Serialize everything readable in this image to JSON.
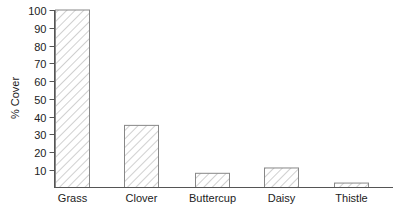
{
  "chart_data": {
    "type": "bar",
    "title": "",
    "xlabel": "",
    "ylabel": "% Cover",
    "categories": [
      "Grass",
      "Clover",
      "Buttercup",
      "Daisy",
      "Thistle"
    ],
    "values": [
      100,
      35,
      8,
      11,
      2.5
    ],
    "ylim": [
      0,
      100
    ],
    "yticks": [
      10,
      20,
      30,
      40,
      50,
      60,
      70,
      80,
      90,
      100
    ],
    "grid": false,
    "legend": null,
    "bar_fill": "diagonal-hatch",
    "colors": {
      "axis": "#555555",
      "bar_border": "#888888",
      "hatch": "#b0b0b0",
      "text": "#222222"
    }
  }
}
